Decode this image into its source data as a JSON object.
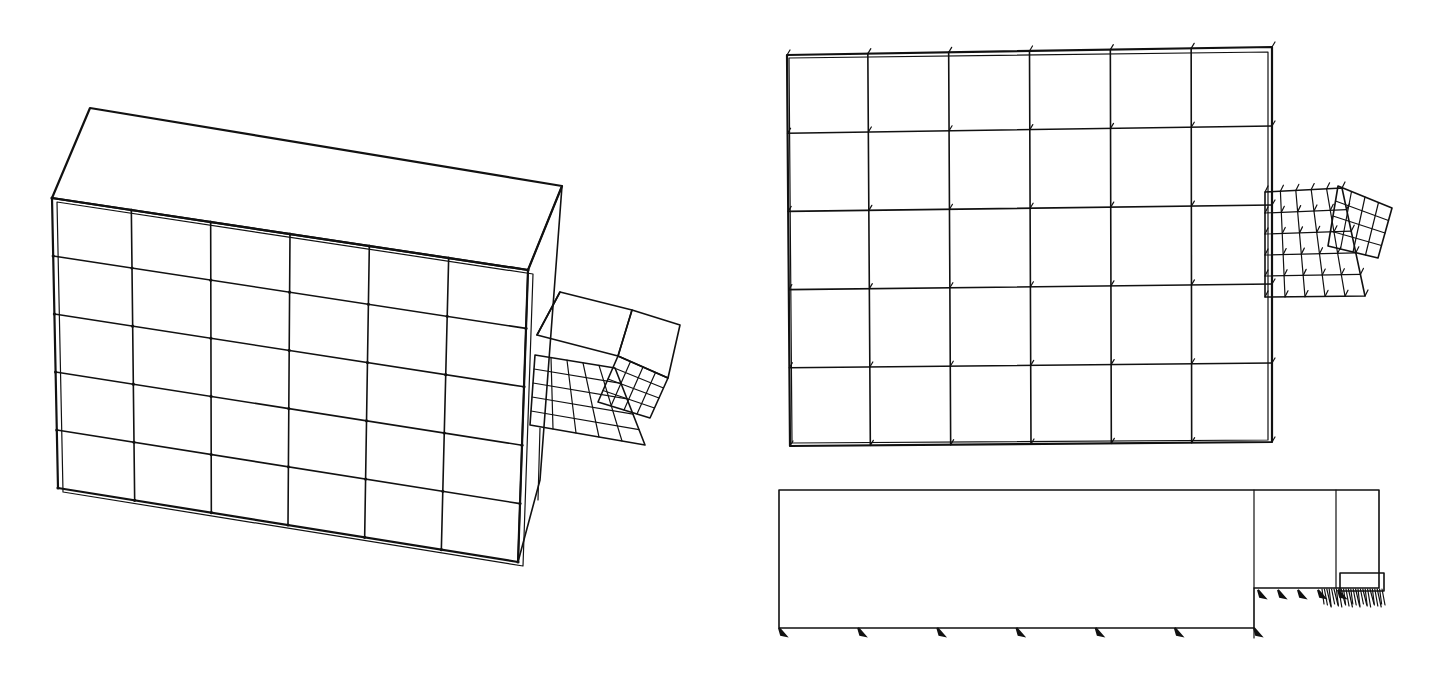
{
  "figure": {
    "background": "#ffffff",
    "line_color": "#111111",
    "views": [
      {
        "id": "isometric-view",
        "label": "",
        "description": "3D isometric finite element mesh of a block with a small deformed appendage",
        "front_face": {
          "corners": [
            [
              52,
              198
            ],
            [
              528,
              270
            ],
            [
              518,
              562
            ],
            [
              58,
              488
            ]
          ],
          "cols": 6,
          "rows": 5
        },
        "top_face": [
          [
            52,
            198
          ],
          [
            90,
            108
          ],
          [
            562,
            186
          ],
          [
            528,
            270
          ]
        ],
        "side_face": [
          [
            528,
            270
          ],
          [
            562,
            186
          ],
          [
            540,
            480
          ],
          [
            518,
            562
          ]
        ],
        "appendage": {
          "box": [
            [
              537,
              335
            ],
            [
              557,
              292
            ],
            [
              632,
              310
            ],
            [
              680,
              325
            ],
            [
              650,
              448
            ],
            [
              530,
              428
            ]
          ],
          "fine_mesh_face": {
            "corners": [
              [
                535,
                355
              ],
              [
                615,
                368
              ],
              [
                645,
                445
              ],
              [
                530,
                425
              ]
            ],
            "cols": 5,
            "rows": 5
          },
          "rotated_mesh_face": {
            "corners": [
              [
                618,
                356
              ],
              [
                668,
                378
              ],
              [
                650,
                418
              ],
              [
                598,
                402
              ]
            ],
            "cols": 4,
            "rows": 4
          }
        }
      },
      {
        "id": "plan-view",
        "label": "",
        "description": "Top (plan) view of the deformed mesh with vector ticks",
        "grid": {
          "corners": [
            [
              787,
              55
            ],
            [
              1272,
              47
            ],
            [
              1272,
              442
            ],
            [
              790,
              446
            ]
          ],
          "cols": 6,
          "rows": 5
        },
        "appendage": {
          "coarse_mesh": {
            "corners": [
              [
                1265,
                192
              ],
              [
                1342,
                188
              ],
              [
                1365,
                296
              ],
              [
                1265,
                297
              ]
            ],
            "cols": 5,
            "rows": 5
          },
          "rotated_mesh": {
            "corners": [
              [
                1338,
                186
              ],
              [
                1392,
                208
              ],
              [
                1378,
                258
              ],
              [
                1328,
                246
              ]
            ],
            "cols": 4,
            "rows": 4
          }
        }
      },
      {
        "id": "elevation-view",
        "label": "",
        "description": "Side elevation showing boundary supports",
        "outline": {
          "x": 779,
          "y": 490,
          "w": 600,
          "h": 138
        },
        "step_x": 1254,
        "step_y": 588,
        "divider_x": 1336,
        "load_block": {
          "x": 1340,
          "y": 573,
          "w": 44,
          "h": 18
        },
        "support_count_bottom": 7,
        "support_count_step": 5
      }
    ]
  }
}
